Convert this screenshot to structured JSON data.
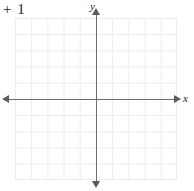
{
  "figure": {
    "width": 194,
    "height": 191,
    "background_color": "#ffffff"
  },
  "expression": {
    "text": "+ 1"
  },
  "chart_data": {
    "type": "scatter",
    "title": "",
    "subtitle": "",
    "xlabel": "x",
    "ylabel": "y",
    "xlim": [
      -5,
      5
    ],
    "ylim": [
      -5,
      5
    ],
    "x": [],
    "y": [],
    "series": [],
    "categories": [],
    "values": [],
    "xticks": [],
    "yticks": [],
    "xticklabels": [],
    "yticklabels": [],
    "annotations": [],
    "legend": {
      "entries": [],
      "position": "none"
    },
    "grid": {
      "visible": true,
      "columns": 10,
      "rows": 10,
      "cell_px": 16.2,
      "color": "#ececec"
    },
    "axes": {
      "color": "#6f6f73",
      "arrow_color": "#5b5b60",
      "x_axis_arrows": [
        "left",
        "right"
      ],
      "y_axis_arrows": [
        "up",
        "down"
      ],
      "origin_px": [
        96,
        99
      ]
    }
  },
  "axes_labels": {
    "x": "x",
    "y": "y"
  },
  "colors": {
    "text": "#231f20",
    "axis": "#6f6f73",
    "grid": "#ececec",
    "background": "#ffffff"
  }
}
